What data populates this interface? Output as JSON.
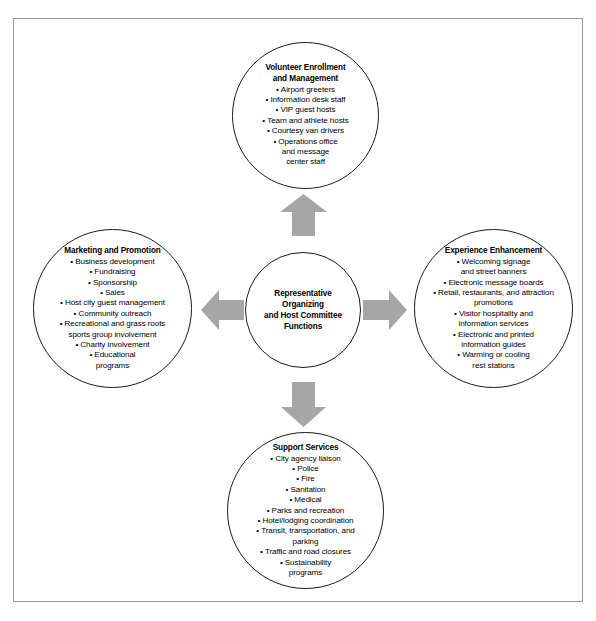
{
  "diagram": {
    "title": "Representative Organizing and Host Committee Functions",
    "arrow_color": "#a6a6a6",
    "circle_stroke": "#1a1a1a",
    "background": "#ffffff",
    "frame_color": "#9a9a9a",
    "center": {
      "title": "Representative\nOrganizing\nand Host Committee\nFunctions"
    },
    "nodes": [
      {
        "id": "top",
        "title": "Volunteer Enrollment\nand Management",
        "items": [
          "Airport greeters",
          "Information desk staff",
          "VIP guest hosts",
          "Team and athlete hosts",
          "Courtesy van drivers",
          "Operations office\nand message\ncenter staff"
        ]
      },
      {
        "id": "left",
        "title": "Marketing and Promotion",
        "items": [
          "Business development",
          "Fundraising",
          "Sponsorship",
          "Sales",
          "Host city guest management",
          "Community outreach",
          "Recreational and grass roots\nsports group involvement",
          "Charity involvement",
          "Educational\nprograms"
        ]
      },
      {
        "id": "right",
        "title": "Experience Enhancement",
        "items": [
          "Welcoming signage\nand street banners",
          "Electronic message boards",
          "Retail, restaurants, and attraction\npromotions",
          "Visitor hospitality and\ninformation services",
          "Electronic and printed\ninformation guides",
          "Warming or cooling\nrest stations"
        ]
      },
      {
        "id": "bottom",
        "title": "Support Services",
        "items": [
          "City agency liaison",
          "Police",
          "Fire",
          "Sanitation",
          "Medical",
          "Parks and recreation",
          "Hotel/lodging coordination",
          "Transit, transportation, and\nparking",
          "Traffic and road closures",
          "Sustainability\nprograms"
        ]
      }
    ],
    "arrows": [
      {
        "id": "arrow-up",
        "direction": "up",
        "from": "center",
        "to": "top"
      },
      {
        "id": "arrow-right",
        "direction": "right",
        "from": "center",
        "to": "right"
      },
      {
        "id": "arrow-down",
        "direction": "down",
        "from": "center",
        "to": "bottom"
      },
      {
        "id": "arrow-left",
        "direction": "left",
        "from": "center",
        "to": "left"
      }
    ]
  }
}
